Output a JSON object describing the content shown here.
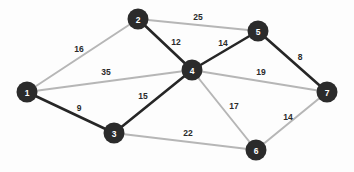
{
  "figure": {
    "kind": "weighted-undirected-graph",
    "background_color": "#fdfdfd",
    "node_color": "#2b2b2b",
    "node_label_color": "#ffffff",
    "weight_label_color": "#2a2a2a",
    "edge_color_highlight": "#262626",
    "edge_color_normal": "#b6b6b6",
    "node_radius": 10.5
  },
  "chart_data": {
    "type": "graph",
    "title": "",
    "nodes": [
      {
        "id": "1",
        "label": "1",
        "x": 27,
        "y": 92
      },
      {
        "id": "2",
        "label": "2",
        "x": 138,
        "y": 19
      },
      {
        "id": "3",
        "label": "3",
        "x": 114,
        "y": 133
      },
      {
        "id": "4",
        "label": "4",
        "x": 192,
        "y": 70
      },
      {
        "id": "5",
        "label": "5",
        "x": 258,
        "y": 31
      },
      {
        "id": "6",
        "label": "6",
        "x": 256,
        "y": 150
      },
      {
        "id": "7",
        "label": "7",
        "x": 327,
        "y": 92
      }
    ],
    "edges": [
      {
        "from": "1",
        "to": "2",
        "weight": "16",
        "style": "normal",
        "lx": 79,
        "ly": 49
      },
      {
        "from": "1",
        "to": "4",
        "weight": "35",
        "style": "normal",
        "lx": 106,
        "ly": 72
      },
      {
        "from": "1",
        "to": "3",
        "weight": "9",
        "style": "highlight",
        "lx": 79,
        "ly": 108
      },
      {
        "from": "2",
        "to": "5",
        "weight": "25",
        "style": "normal",
        "lx": 198,
        "ly": 17
      },
      {
        "from": "2",
        "to": "4",
        "weight": "12",
        "style": "highlight",
        "lx": 176,
        "ly": 42
      },
      {
        "from": "4",
        "to": "5",
        "weight": "14",
        "style": "highlight",
        "lx": 223,
        "ly": 43
      },
      {
        "from": "5",
        "to": "7",
        "weight": "8",
        "style": "highlight",
        "lx": 300,
        "ly": 57
      },
      {
        "from": "4",
        "to": "7",
        "weight": "19",
        "style": "normal",
        "lx": 261,
        "ly": 72
      },
      {
        "from": "3",
        "to": "4",
        "weight": "15",
        "style": "highlight",
        "lx": 143,
        "ly": 96
      },
      {
        "from": "4",
        "to": "6",
        "weight": "17",
        "style": "normal",
        "lx": 234,
        "ly": 106
      },
      {
        "from": "3",
        "to": "6",
        "weight": "22",
        "style": "normal",
        "lx": 188,
        "ly": 133
      },
      {
        "from": "6",
        "to": "7",
        "weight": "14",
        "style": "normal",
        "lx": 288,
        "ly": 117
      }
    ]
  }
}
